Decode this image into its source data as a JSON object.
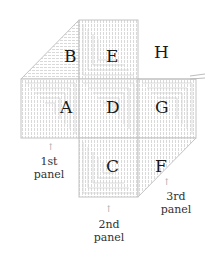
{
  "diagram": {
    "type": "knitting-panel-layout",
    "squares": [
      {
        "label": "A",
        "row": 1,
        "col": 0,
        "shape": "square"
      },
      {
        "label": "B",
        "row": 0,
        "col": 0,
        "shape": "triangle"
      },
      {
        "label": "C",
        "row": 2,
        "col": 1,
        "shape": "square"
      },
      {
        "label": "D",
        "row": 1,
        "col": 1,
        "shape": "square"
      },
      {
        "label": "E",
        "row": 0,
        "col": 1,
        "shape": "square"
      },
      {
        "label": "F",
        "row": 2,
        "col": 2,
        "shape": "triangle"
      },
      {
        "label": "G",
        "row": 1,
        "col": 2,
        "shape": "square"
      },
      {
        "label": "H",
        "row": 0,
        "col": 2,
        "shape": "empty"
      }
    ],
    "labels": {
      "A": "A",
      "B": "B",
      "C": "C",
      "D": "D",
      "E": "E",
      "F": "F",
      "G": "G",
      "H": "H"
    },
    "captions": {
      "panel1": {
        "line1": "1st",
        "line2": "panel"
      },
      "panel2": {
        "line1": "2nd",
        "line2": "panel"
      },
      "panel3": {
        "line1": "3rd",
        "line2": "panel"
      }
    },
    "arrow_glyph": "↑",
    "colors": {
      "stitch": "#c9c9c9",
      "text": "#1a1a1a"
    }
  }
}
